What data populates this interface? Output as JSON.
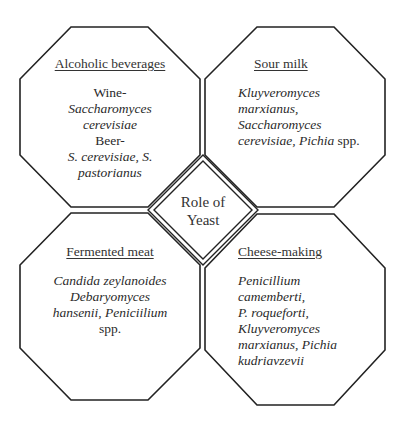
{
  "diagram": {
    "center": {
      "line1": "Role of",
      "line2": "Yeast"
    },
    "quadrants": [
      {
        "id": "alcoholic-beverages",
        "title": "Alcoholic beverages",
        "lines": [
          {
            "text": "Wine-",
            "italic": false
          },
          {
            "text": "Saccharomyces",
            "italic": true
          },
          {
            "text": "cerevisiae",
            "italic": true
          },
          {
            "text": "Beer-",
            "italic": false
          },
          {
            "text": "S. cerevisiae, S.",
            "italic": true
          },
          {
            "text": "pastorianus",
            "italic": true
          }
        ]
      },
      {
        "id": "sour-milk",
        "title": "Sour milk",
        "lines": [
          {
            "text": "Kluyveromyces",
            "italic": true
          },
          {
            "text": "marxianus,",
            "italic": true
          },
          {
            "text": "Saccharomyces",
            "italic": true
          },
          {
            "text": "cerevisiae, Pichia",
            "italic": true,
            "suffix": " spp."
          }
        ]
      },
      {
        "id": "fermented-meat",
        "title": "Fermented meat",
        "lines": [
          {
            "text": "Candida zeylanoides",
            "italic": true
          },
          {
            "text": "Debaryomyces",
            "italic": true
          },
          {
            "text": "hansenii, Peniciilium",
            "italic": true
          },
          {
            "text": "spp.",
            "italic": false
          }
        ]
      },
      {
        "id": "cheese-making",
        "title": "Cheese-making",
        "lines": [
          {
            "text": "Penicillium",
            "italic": true
          },
          {
            "text": "camemberti,",
            "italic": true
          },
          {
            "text": "P. roqueforti,",
            "italic": true
          },
          {
            "text": "Kluyveromyces",
            "italic": true
          },
          {
            "text": "marxianus, Pichia",
            "italic": true
          },
          {
            "text": "kudriavzevii",
            "italic": true
          }
        ]
      }
    ],
    "colors": {
      "stroke": "#222222",
      "text": "#2a2a2a",
      "background": "#ffffff"
    }
  }
}
